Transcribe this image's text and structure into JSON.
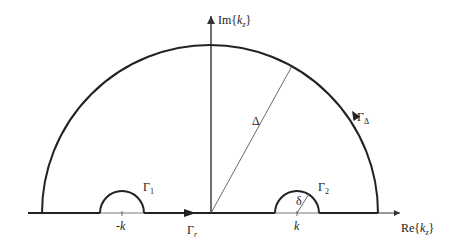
{
  "figure": {
    "axes": {
      "x_label_prefix": "Re{",
      "x_label_var": "k",
      "x_label_sub": "z",
      "x_label_suffix": "}",
      "y_label_prefix": "Im{",
      "y_label_var": "k",
      "y_label_sub": "z",
      "y_label_suffix": "}"
    },
    "contours": {
      "gamma_1": {
        "symbol": "Γ",
        "sub": "1"
      },
      "gamma_2": {
        "symbol": "Γ",
        "sub": "2"
      },
      "gamma_delta": {
        "symbol": "Γ",
        "sub": "Δ"
      },
      "gamma_r": {
        "symbol": "Γ",
        "sub": "r"
      }
    },
    "radius_labels": {
      "big_radius": "Δ",
      "small_radius": "δ"
    },
    "tick_labels": {
      "neg_k": "-k",
      "pos_k": "k"
    },
    "colors": {
      "contour": "#222222",
      "axis": "#333333",
      "radius_line": "#444444"
    }
  }
}
